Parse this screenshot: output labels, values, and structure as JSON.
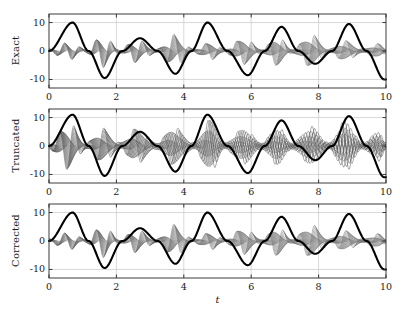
{
  "figure": {
    "background": "#ffffff",
    "axis_color": "#262626",
    "grid_color": "#c8c8c8",
    "thick_curve_color": "#000000",
    "bundle_color": "#7a7a7a",
    "xlabel": "t"
  },
  "chart_data": {
    "type": "line",
    "title": "",
    "xlabel": "t",
    "ylabel": "",
    "xlim": [
      0,
      10
    ],
    "ylim": [
      -13,
      13
    ],
    "xticks": [
      0,
      2,
      4,
      6,
      8,
      10
    ],
    "xticklabels": [
      "0",
      "2",
      "4",
      "6",
      "8",
      "10"
    ],
    "yticks": [
      10,
      0,
      -10
    ],
    "yticklabels": [
      "10",
      "0",
      "-10"
    ],
    "grid": true,
    "legend_position": "none",
    "n_bundle_trajectories": 18,
    "panels": [
      {
        "label": "Exact",
        "series": [
          {
            "name": "reference-solution",
            "style": "thick-black",
            "description": "Slow beating oscillation, amplitude 10, beat envelope",
            "amplitude": 10,
            "carrier_frequency": 4.4,
            "beat_frequency": 0.62,
            "peaks_t": [
              0.7,
              2.7,
              4.7,
              6.9,
              8.9
            ],
            "peaks_y": [
              10,
              4.5,
              10,
              8.5,
              9.5
            ],
            "troughs_t": [
              1.65,
              3.75,
              5.9,
              7.9,
              9.95
            ],
            "troughs_y": [
              -9.5,
              -8,
              -8.5,
              -4.5,
              -10
            ]
          },
          {
            "name": "trajectory-bundle",
            "style": "thin-gray",
            "description": "Tight bundle of fast oscillations modulated by slow envelope",
            "envelope_max": 5.5,
            "envelope_nodes_t": [
              0,
              1.1,
              2.1,
              3.2,
              4.3,
              5.2,
              6.3,
              7.2,
              8.3,
              9.3,
              10
            ],
            "envelope_peaks_t": [
              0.6,
              1.6,
              2.6,
              3.7,
              4.8,
              5.8,
              6.8,
              7.8,
              8.8,
              9.8
            ],
            "envelope_peaks_y": [
              3.0,
              5.5,
              4.0,
              5.5,
              3.0,
              4.5,
              5.0,
              5.5,
              3.5,
              2.5
            ]
          }
        ]
      },
      {
        "label": "Truncated",
        "series": [
          {
            "name": "reference-solution",
            "style": "thick-black",
            "description": "Slow beating oscillation, amplitude 11, slightly larger than exact",
            "amplitude": 11,
            "carrier_frequency": 4.4,
            "beat_frequency": 0.62,
            "peaks_t": [
              0.7,
              2.7,
              4.7,
              6.9,
              8.9
            ],
            "peaks_y": [
              11,
              5.0,
              11,
              9.0,
              10.5
            ],
            "troughs_t": [
              1.65,
              3.75,
              5.9,
              7.9,
              9.95
            ],
            "troughs_y": [
              -10.5,
              -9,
              -9.5,
              -5,
              -11
            ]
          },
          {
            "name": "trajectory-bundle",
            "style": "thin-gray-spread",
            "description": "Widely spread bundle, individual trajectories resolved, larger amplitude error",
            "envelope_max": 9.5,
            "envelope_nodes_t": [
              0,
              1.1,
              2.1,
              3.2,
              4.3,
              5.2,
              6.3,
              7.2,
              8.3,
              9.3,
              10
            ],
            "envelope_peaks_t": [
              0.6,
              1.6,
              2.6,
              3.7,
              4.8,
              5.8,
              6.8,
              7.8,
              8.8,
              9.8
            ],
            "envelope_peaks_y": [
              8.0,
              6.0,
              6.0,
              6.5,
              9.0,
              6.0,
              6.5,
              6.5,
              8.5,
              5.0
            ]
          }
        ]
      },
      {
        "label": "Corrected",
        "series": [
          {
            "name": "reference-solution",
            "style": "thick-black",
            "description": "Slow beating oscillation, amplitude 10, matches exact",
            "amplitude": 10,
            "carrier_frequency": 4.4,
            "beat_frequency": 0.62,
            "peaks_t": [
              0.7,
              2.7,
              4.7,
              6.9,
              8.9
            ],
            "peaks_y": [
              10,
              4.5,
              10,
              8.5,
              9.5
            ],
            "troughs_t": [
              1.65,
              3.75,
              5.9,
              7.9,
              9.95
            ],
            "troughs_y": [
              -9.5,
              -8,
              -8.5,
              -4.5,
              -10
            ]
          },
          {
            "name": "trajectory-bundle",
            "style": "thin-gray",
            "description": "Tight bundle recovering the exact envelope",
            "envelope_max": 5.5,
            "envelope_nodes_t": [
              0,
              1.1,
              2.1,
              3.2,
              4.3,
              5.2,
              6.3,
              7.2,
              8.3,
              9.3,
              10
            ],
            "envelope_peaks_t": [
              0.6,
              1.6,
              2.6,
              3.7,
              4.8,
              5.8,
              6.8,
              7.8,
              8.8,
              9.8
            ],
            "envelope_peaks_y": [
              3.0,
              5.5,
              4.0,
              5.5,
              3.0,
              4.5,
              5.0,
              5.5,
              3.5,
              2.5
            ]
          }
        ]
      }
    ]
  }
}
